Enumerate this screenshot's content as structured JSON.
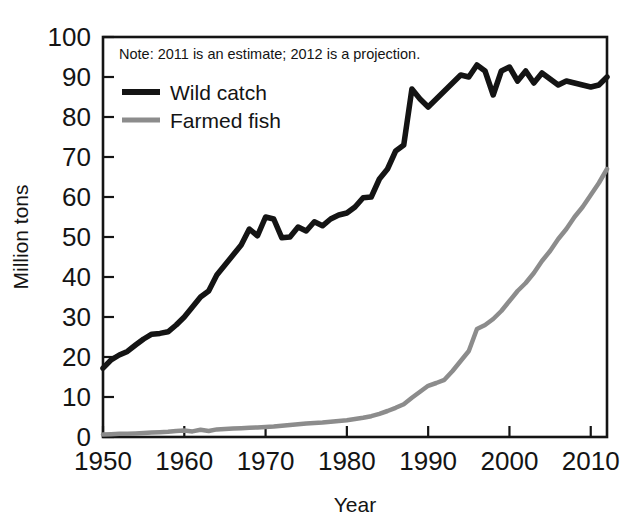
{
  "chart_data": {
    "type": "line",
    "title": "",
    "subtitle": "",
    "xlabel": "Year",
    "ylabel": "Million tons",
    "xlim": [
      1950,
      2012
    ],
    "ylim": [
      0,
      100
    ],
    "grid": false,
    "legend_position": "top-left inside plot",
    "annotations": [
      "Note: 2011 is an estimate; 2012 is a projection."
    ],
    "x_tick_labels": [
      "1950",
      "1960",
      "1970",
      "1980",
      "1990",
      "2000",
      "2010"
    ],
    "x_ticks": [
      1950,
      1960,
      1970,
      1980,
      1990,
      2000,
      2010
    ],
    "y_tick_labels": [
      "0",
      "10",
      "20",
      "30",
      "40",
      "50",
      "60",
      "70",
      "80",
      "90",
      "100"
    ],
    "y_ticks": [
      0,
      10,
      20,
      30,
      40,
      50,
      60,
      70,
      80,
      90,
      100
    ],
    "x": [
      1950,
      1951,
      1952,
      1953,
      1954,
      1955,
      1956,
      1957,
      1958,
      1959,
      1960,
      1961,
      1962,
      1963,
      1964,
      1965,
      1966,
      1967,
      1968,
      1969,
      1970,
      1971,
      1972,
      1973,
      1974,
      1975,
      1976,
      1977,
      1978,
      1979,
      1980,
      1981,
      1982,
      1983,
      1984,
      1985,
      1986,
      1987,
      1988,
      1989,
      1990,
      1991,
      1992,
      1993,
      1994,
      1995,
      1996,
      1997,
      1998,
      1999,
      2000,
      2001,
      2002,
      2003,
      2004,
      2005,
      2006,
      2007,
      2008,
      2009,
      2010,
      2011,
      2012
    ],
    "series": [
      {
        "name": "Wild catch",
        "color": "#141414",
        "values": [
          17.2,
          19.3,
          20.5,
          21.4,
          23.0,
          24.5,
          25.7,
          25.9,
          26.3,
          28.0,
          30.0,
          32.5,
          35.0,
          36.5,
          40.5,
          43.0,
          45.5,
          48.0,
          52.0,
          50.3,
          55.0,
          54.5,
          49.8,
          50.0,
          52.5,
          51.5,
          53.8,
          52.8,
          54.5,
          55.5,
          56.0,
          57.5,
          59.8,
          60.0,
          64.5,
          67.0,
          71.5,
          73.0,
          87.0,
          84.5,
          82.5,
          84.5,
          86.5,
          88.5,
          90.5,
          90.0,
          93.0,
          91.5,
          85.5,
          91.5,
          92.5,
          89.0,
          91.5,
          88.5,
          91.0,
          89.5,
          88.0,
          89.0,
          88.5,
          88.0,
          87.5,
          88.0,
          90.0
        ]
      },
      {
        "name": "Farmed fish",
        "color": "#8c8c8c",
        "values": [
          0.6,
          0.7,
          0.8,
          0.8,
          0.9,
          1.0,
          1.1,
          1.2,
          1.3,
          1.5,
          1.6,
          1.4,
          1.8,
          1.5,
          1.9,
          2.0,
          2.1,
          2.2,
          2.3,
          2.4,
          2.5,
          2.6,
          2.8,
          3.0,
          3.2,
          3.4,
          3.5,
          3.6,
          3.8,
          4.0,
          4.2,
          4.5,
          4.8,
          5.2,
          5.8,
          6.5,
          7.3,
          8.2,
          9.8,
          11.3,
          12.8,
          13.5,
          14.3,
          16.5,
          19.0,
          21.5,
          27.0,
          28.0,
          29.5,
          31.5,
          34.0,
          36.5,
          38.5,
          41.0,
          44.0,
          46.5,
          49.5,
          52.0,
          55.0,
          57.5,
          60.5,
          63.5,
          67.0
        ]
      }
    ]
  },
  "legend": {
    "items": [
      {
        "label": "Wild catch",
        "color": "#141414",
        "thickness": 6
      },
      {
        "label": "Farmed fish",
        "color": "#8c8c8c",
        "thickness": 5
      }
    ]
  },
  "note": {
    "text": "Note: 2011 is an estimate; 2012 is a projection."
  },
  "axes": {
    "x_title": "Year",
    "y_title": "Million tons"
  }
}
